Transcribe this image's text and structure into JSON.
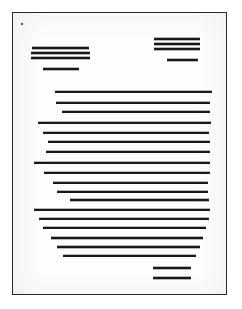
{
  "document": {
    "kind": "scanned-document-page",
    "description": "Black-and-white scan of a printed page in which every line of text is reproduced as a solid horizontal stroke",
    "page_label": "",
    "colors": {
      "paper": "#fdfdfc",
      "ink": "#1b1b1b",
      "frame": "#2a2a2a",
      "backdrop": "#ffffff",
      "mark": "#5a5a5a"
    },
    "frame": {
      "x": 12,
      "y": 12,
      "width": 215,
      "height": 283,
      "border_width": 1.4
    },
    "corner_mark": {
      "x": 20,
      "y": 22,
      "width": 2,
      "height": 2
    },
    "line_thickness": {
      "heading": 2.0,
      "body": 1.7,
      "footer": 2.0
    }
  },
  "regions": {
    "header_left": {
      "name": "left header block",
      "align": "left",
      "lines": [
        {
          "x": 31,
          "y": 46,
          "width": 57,
          "thickness": 2.0
        },
        {
          "x": 30,
          "y": 51,
          "width": 59,
          "thickness": 2.2
        },
        {
          "x": 30,
          "y": 56,
          "width": 59,
          "thickness": 2.0
        },
        {
          "x": 42,
          "y": 67,
          "width": 36,
          "thickness": 2.2
        }
      ]
    },
    "header_right": {
      "name": "right header block",
      "align": "right",
      "lines": [
        {
          "x": 153,
          "y": 37,
          "width": 46,
          "thickness": 2.0
        },
        {
          "x": 153,
          "y": 42,
          "width": 46,
          "thickness": 2.0
        },
        {
          "x": 153,
          "y": 47,
          "width": 46,
          "thickness": 2.2
        },
        {
          "x": 166,
          "y": 58,
          "width": 31,
          "thickness": 2.2
        }
      ]
    },
    "body": {
      "name": "body paragraph block",
      "align": "justified",
      "lines": [
        {
          "x": 54,
          "y": 90,
          "width": 157,
          "thickness": 1.8
        },
        {
          "x": 55,
          "y": 101,
          "width": 154,
          "thickness": 1.8
        },
        {
          "x": 61,
          "y": 110,
          "width": 148,
          "thickness": 1.8
        },
        {
          "x": 37,
          "y": 121,
          "width": 173,
          "thickness": 1.9
        },
        {
          "x": 42,
          "y": 131,
          "width": 166,
          "thickness": 1.8
        },
        {
          "x": 47,
          "y": 140,
          "width": 162,
          "thickness": 1.9
        },
        {
          "x": 45,
          "y": 150,
          "width": 164,
          "thickness": 1.8
        },
        {
          "x": 33,
          "y": 161,
          "width": 176,
          "thickness": 1.9
        },
        {
          "x": 43,
          "y": 171,
          "width": 166,
          "thickness": 1.8
        },
        {
          "x": 52,
          "y": 181,
          "width": 155,
          "thickness": 1.8
        },
        {
          "x": 56,
          "y": 190,
          "width": 151,
          "thickness": 1.8
        },
        {
          "x": 69,
          "y": 198,
          "width": 139,
          "thickness": 2.0
        },
        {
          "x": 33,
          "y": 208,
          "width": 176,
          "thickness": 1.9
        },
        {
          "x": 38,
          "y": 217,
          "width": 170,
          "thickness": 1.9
        },
        {
          "x": 42,
          "y": 226,
          "width": 163,
          "thickness": 1.9
        },
        {
          "x": 50,
          "y": 236,
          "width": 152,
          "thickness": 2.0
        },
        {
          "x": 56,
          "y": 245,
          "width": 143,
          "thickness": 2.0
        },
        {
          "x": 62,
          "y": 254,
          "width": 133,
          "thickness": 1.8
        }
      ]
    },
    "footer": {
      "name": "footer block",
      "align": "right",
      "lines": [
        {
          "x": 152,
          "y": 266,
          "width": 38,
          "thickness": 2.0
        },
        {
          "x": 152,
          "y": 276,
          "width": 38,
          "thickness": 2.2
        }
      ]
    }
  }
}
